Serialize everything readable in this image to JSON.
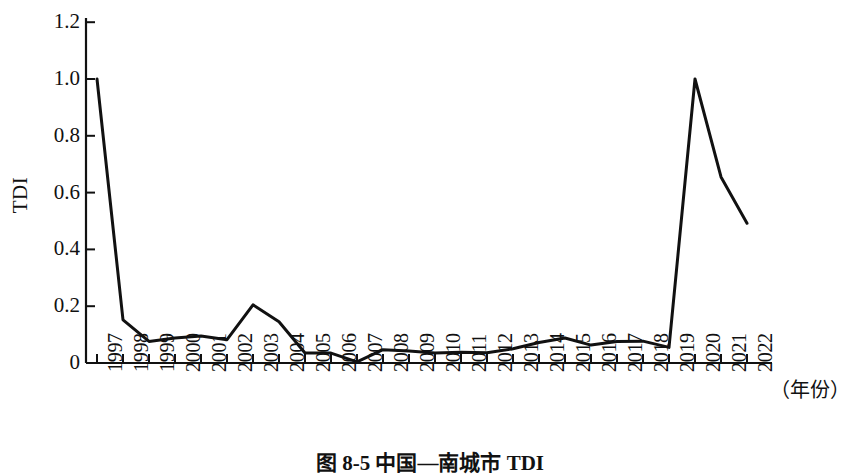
{
  "chart_data": {
    "type": "line",
    "title": "图 8-5  中国—南城市 TDI",
    "xlabel": "（年份）",
    "ylabel": "TDI",
    "ylim": [
      0,
      1.2
    ],
    "ytick_labels": [
      "1.2",
      "1.0",
      "0.8",
      "0.6",
      "0.4",
      "0.2",
      "0"
    ],
    "ytick_values": [
      1.2,
      1.0,
      0.8,
      0.6,
      0.4,
      0.2,
      0
    ],
    "grid": false,
    "legend": "none",
    "categories": [
      "1997",
      "1998",
      "1999",
      "2000",
      "2001",
      "2002",
      "2003",
      "2004",
      "2005",
      "2006",
      "2007",
      "2008",
      "2009",
      "2010",
      "2011",
      "2012",
      "2013",
      "2014",
      "2015",
      "2016",
      "2017",
      "2018",
      "2019",
      "2020",
      "2021",
      "2022"
    ],
    "values": [
      1.0,
      0.152,
      0.076,
      0.088,
      0.095,
      0.082,
      0.205,
      0.145,
      0.035,
      0.035,
      0.004,
      0.047,
      0.042,
      0.035,
      0.038,
      0.036,
      0.05,
      0.072,
      0.088,
      0.063,
      0.076,
      0.077,
      0.055,
      1.0,
      0.655,
      0.492
    ],
    "series_name": "TDI",
    "line_color": "#111111",
    "line_width": 3
  },
  "axis": {
    "unit_label": "（年份）",
    "y_axis_title": "TDI"
  },
  "caption": {
    "text": "图 8-5  中国—南城市 TDI"
  }
}
